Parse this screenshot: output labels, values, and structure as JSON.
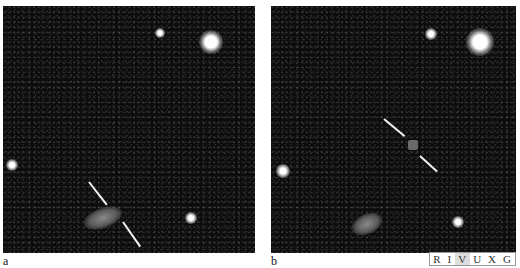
{
  "figure": {
    "panels": [
      {
        "label": "a",
        "description": "deep field image with slit marks indicating faint galaxy"
      },
      {
        "label": "b",
        "description": "deep field image with slit marks indicating faint object"
      }
    ],
    "band_strip": {
      "letters": [
        "R",
        "I",
        "V",
        "U",
        "X",
        "G"
      ],
      "highlighted": [
        "V"
      ]
    }
  }
}
